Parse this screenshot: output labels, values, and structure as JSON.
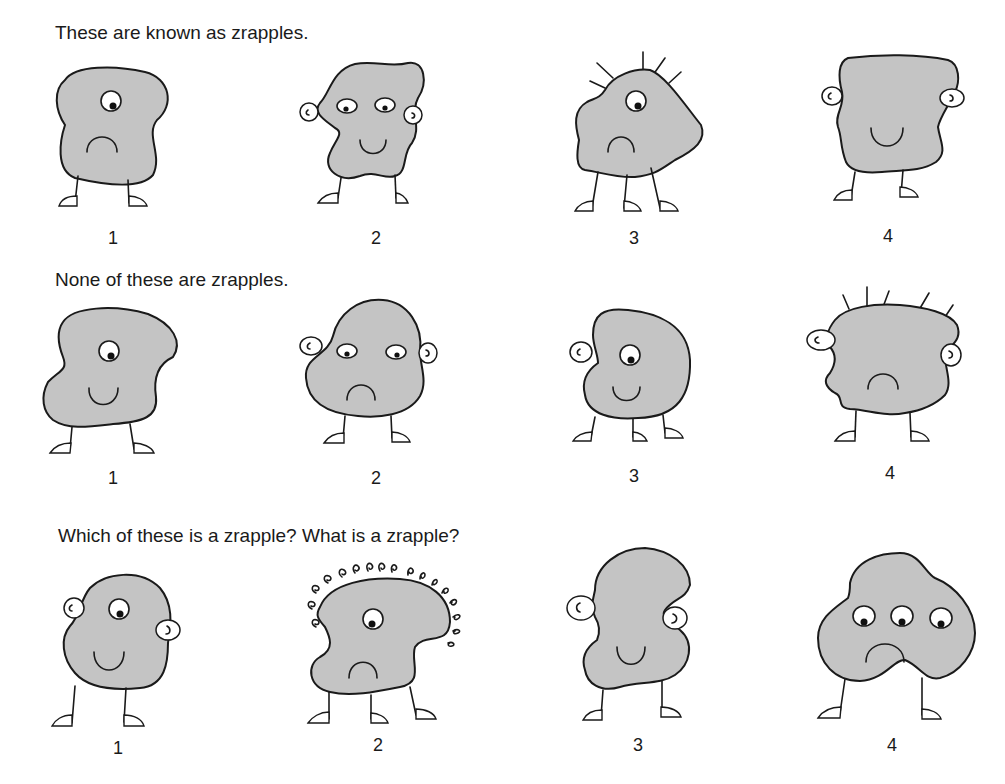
{
  "sections": [
    {
      "heading": "These are known as zrapples.",
      "creatures": [
        {
          "label": "1",
          "eyes": 1,
          "mouth": "frown",
          "ears": false,
          "hair": "none",
          "legs": 2
        },
        {
          "label": "2",
          "eyes": 2,
          "mouth": "smile",
          "ears": true,
          "hair": "none",
          "legs": 2
        },
        {
          "label": "3",
          "eyes": 1,
          "mouth": "frown",
          "ears": false,
          "hair": "spikes",
          "legs": 3
        },
        {
          "label": "4",
          "eyes": 0,
          "mouth": "smile",
          "ears": true,
          "hair": "none",
          "legs": 2
        }
      ]
    },
    {
      "heading": "None of these are zrapples.",
      "creatures": [
        {
          "label": "1",
          "eyes": 1,
          "mouth": "smile",
          "ears": false,
          "hair": "none",
          "legs": 2
        },
        {
          "label": "2",
          "eyes": 2,
          "mouth": "frown",
          "ears": true,
          "hair": "none",
          "legs": 2
        },
        {
          "label": "3",
          "eyes": 1,
          "mouth": "smile",
          "ears": true,
          "hair": "none",
          "legs": 3
        },
        {
          "label": "4",
          "eyes": 0,
          "mouth": "frown",
          "ears": true,
          "hair": "spikes",
          "legs": 2
        }
      ]
    },
    {
      "heading": "Which of these is a zrapple?  What is a zrapple?",
      "creatures": [
        {
          "label": "1",
          "eyes": 1,
          "mouth": "smile",
          "ears": true,
          "hair": "none",
          "legs": 2
        },
        {
          "label": "2",
          "eyes": 1,
          "mouth": "frown",
          "ears": false,
          "hair": "curls",
          "legs": 3
        },
        {
          "label": "3",
          "eyes": 0,
          "mouth": "smile",
          "ears": true,
          "hair": "none",
          "legs": 2
        },
        {
          "label": "4",
          "eyes": 3,
          "mouth": "frown",
          "ears": false,
          "hair": "none",
          "legs": 2
        }
      ]
    }
  ],
  "colors": {
    "body": "#c4c4c4",
    "ink": "#1a1a1a",
    "background": "#ffffff"
  }
}
